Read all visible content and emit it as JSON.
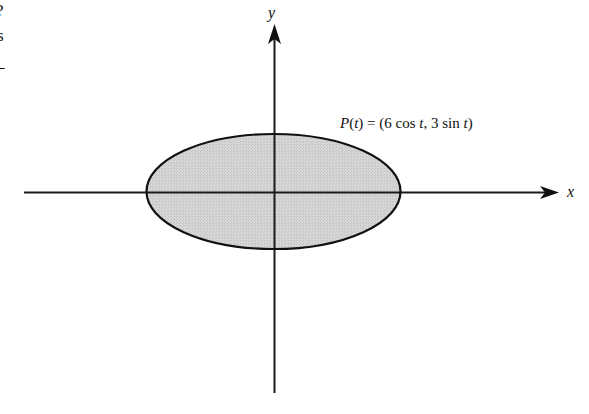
{
  "margin_fragments": {
    "line1": "?",
    "line2": "s",
    "line3": "–"
  },
  "axes": {
    "x_label": "x",
    "y_label": "y"
  },
  "curve": {
    "label_P": "P",
    "label_open": "(",
    "label_t1": "t",
    "label_mid1": ") = (6 cos ",
    "label_t2": "t",
    "label_mid2": ", 3 sin ",
    "label_t3": "t",
    "label_close": ")",
    "fill_color": "#d3d3d3",
    "stroke_color": "#111111"
  },
  "geometry": {
    "origin": [
      275,
      192
    ],
    "ellipse_center": [
      273.5,
      191.5
    ],
    "rx": 127,
    "ry": 57.5,
    "x_axis": [
      24,
      558
    ],
    "y_axis": [
      25,
      393
    ]
  }
}
